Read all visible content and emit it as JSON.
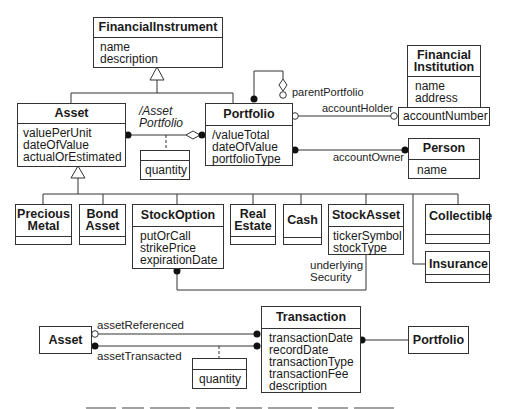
{
  "diagram": {
    "type": "UML class diagram",
    "classes": {
      "financial_instrument": {
        "name": "FinancialInstrument",
        "attributes": [
          "name",
          "description"
        ]
      },
      "asset": {
        "name": "Asset",
        "attributes": [
          "valuePerUnit",
          "dateOfValue",
          "actualOrEstimated"
        ]
      },
      "portfolio": {
        "name": "Portfolio",
        "attributes": [
          "/valueTotal",
          "dateOfValue",
          "portfolioType"
        ]
      },
      "financial_institution": {
        "name_line1": "Financial",
        "name_line2": "Institution",
        "attributes": [
          "name",
          "address"
        ],
        "qualifier": "accountNumber"
      },
      "person": {
        "name": "Person",
        "attributes": [
          "name"
        ]
      },
      "precious_metal": {
        "name_line1": "Precious",
        "name_line2": "Metal"
      },
      "bond_asset": {
        "name_line1": "Bond",
        "name_line2": "Asset"
      },
      "stock_option": {
        "name": "StockOption",
        "attributes": [
          "putOrCall",
          "strikePrice",
          "expirationDate"
        ]
      },
      "real_estate": {
        "name_line1": "Real",
        "name_line2": "Estate"
      },
      "cash": {
        "name": "Cash"
      },
      "stock_asset": {
        "name": "StockAsset",
        "attributes": [
          "tickerSymbol",
          "stockType"
        ]
      },
      "collectible": {
        "name": "Collectible"
      },
      "insurance": {
        "name": "Insurance"
      },
      "asset_lower": {
        "name": "Asset"
      },
      "transaction": {
        "name": "Transaction",
        "attributes": [
          "transactionDate",
          "recordDate",
          "transactionType",
          "transactionFee",
          "description"
        ]
      },
      "portfolio_lower": {
        "name": "Portfolio"
      }
    },
    "association_classes": {
      "asset_portfolio_link": {
        "attributes": [
          "quantity"
        ]
      },
      "asset_transaction_link": {
        "attributes": [
          "quantity"
        ]
      }
    },
    "labels": {
      "asset_portfolio_line1": "/Asset",
      "asset_portfolio_line2": "Portfolio",
      "parent_portfolio": "parentPortfolio",
      "account_holder": "accountHolder",
      "account_owner": "accountOwner",
      "underlying_line1": "underlying",
      "underlying_line2": "Security",
      "asset_referenced": "assetReferenced",
      "asset_transacted": "assetTransacted"
    },
    "colors": {
      "line": "#333333",
      "text": "#1a1a1a",
      "background": "#ffffff"
    }
  }
}
